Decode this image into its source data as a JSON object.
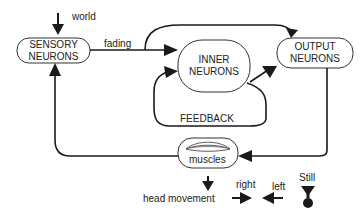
{
  "nodes": {
    "sensory": {
      "line1": "SENSORY",
      "line2": "NEURONS"
    },
    "inner": {
      "line1": "INNER",
      "line2": "NEURONS"
    },
    "output": {
      "line1": "OUTPUT",
      "line2": "NEURONS"
    },
    "muscles": {
      "label": "muscles"
    }
  },
  "edges": {
    "world": "world",
    "fading": "fading",
    "feedback": "FEEDBACK"
  },
  "legend": {
    "head_movement": "head movement",
    "right": "right",
    "left": "left",
    "still": "Still"
  },
  "icons": {
    "muscle_glyph": "muscle-fibers-icon",
    "still_glyph": "hourglass-still-icon"
  }
}
